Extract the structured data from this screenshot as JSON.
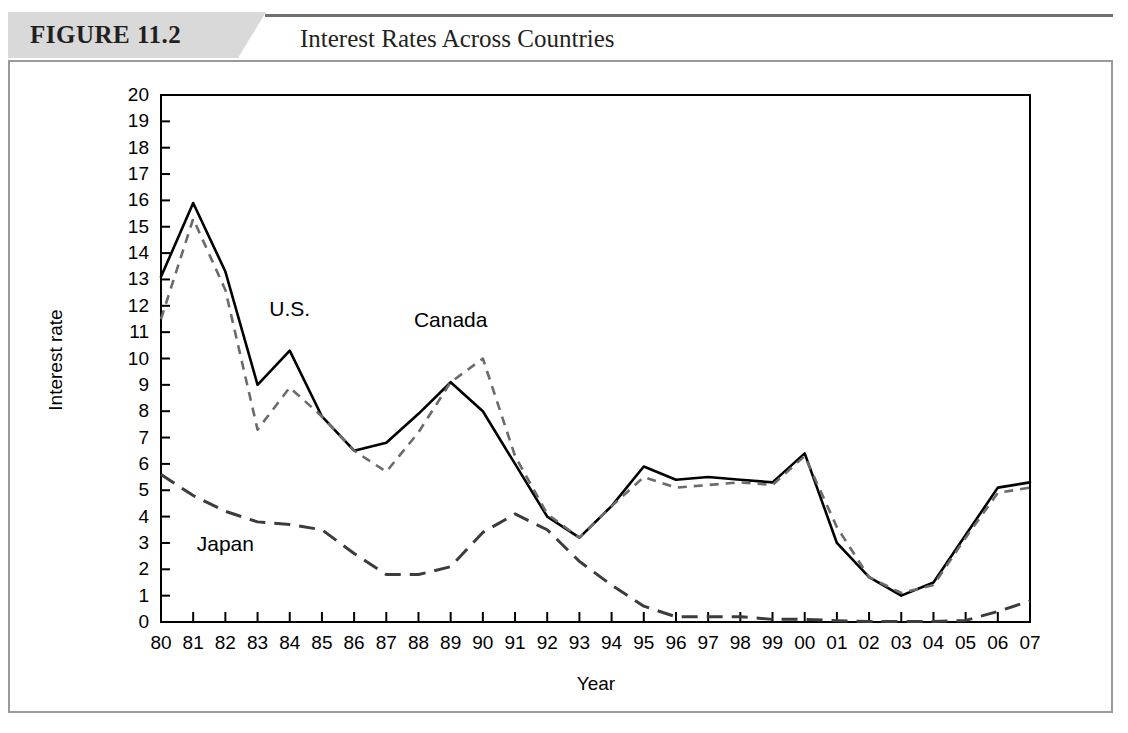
{
  "header": {
    "figure_tag": "FIGURE 11.2",
    "title": "Interest Rates Across Countries"
  },
  "chart_data": {
    "type": "line",
    "title": "Interest Rates Across Countries",
    "xlabel": "Year",
    "ylabel": "Interest rate",
    "xlim": [
      0,
      27
    ],
    "ylim": [
      0,
      20
    ],
    "grid": false,
    "legend_position": "inline-annotations",
    "categories": [
      "80",
      "81",
      "82",
      "83",
      "84",
      "85",
      "86",
      "87",
      "88",
      "89",
      "90",
      "91",
      "92",
      "93",
      "94",
      "95",
      "96",
      "97",
      "98",
      "99",
      "00",
      "01",
      "02",
      "03",
      "04",
      "05",
      "06",
      "07"
    ],
    "yticks": [
      0,
      1,
      2,
      3,
      4,
      5,
      6,
      7,
      8,
      9,
      10,
      11,
      12,
      13,
      14,
      15,
      16,
      17,
      18,
      19,
      20
    ],
    "series": [
      {
        "name": "Canada",
        "style": "solid",
        "color": "#000000",
        "values": [
          13.1,
          15.9,
          13.3,
          9.0,
          10.3,
          7.8,
          6.5,
          6.8,
          7.9,
          9.1,
          8.0,
          6.0,
          4.0,
          3.2,
          4.4,
          5.9,
          5.4,
          5.5,
          5.4,
          5.3,
          6.4,
          3.0,
          1.7,
          1.0,
          1.5,
          3.3,
          5.1,
          5.3
        ]
      },
      {
        "name": "U.S.",
        "style": "dashed",
        "color": "#6b6b6b",
        "values": [
          11.5,
          15.3,
          12.6,
          7.3,
          8.9,
          7.8,
          6.5,
          5.7,
          7.2,
          9.1,
          10.0,
          6.3,
          4.1,
          3.2,
          4.4,
          5.5,
          5.1,
          5.2,
          5.3,
          5.2,
          6.3,
          3.6,
          1.7,
          1.1,
          1.4,
          3.2,
          4.9,
          5.1
        ]
      },
      {
        "name": "Japan",
        "style": "long-dashed",
        "color": "#3c3c3c",
        "values": [
          5.6,
          4.8,
          4.2,
          3.8,
          3.7,
          3.5,
          2.6,
          1.8,
          1.8,
          2.1,
          3.4,
          4.1,
          3.5,
          2.3,
          1.4,
          0.6,
          0.2,
          0.2,
          0.2,
          0.1,
          0.1,
          0.05,
          0.02,
          0.02,
          0.02,
          0.06,
          0.4,
          0.8
        ]
      }
    ],
    "annotations": [
      {
        "label": "U.S.",
        "year": "84",
        "value": 11.6
      },
      {
        "label": "Canada",
        "year": "89",
        "value": 11.2
      },
      {
        "label": "Japan",
        "year": "82",
        "value": 2.7
      }
    ]
  }
}
